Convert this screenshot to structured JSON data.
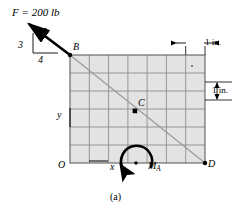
{
  "figure": {
    "caption": "(a)",
    "type": "statics free-body diagram",
    "grid": {
      "columns": 7,
      "rows": 6,
      "cell_size_label": "1 in.",
      "fill_color": "#e3e3e3",
      "line_color": "#8c8c8c",
      "border_color": "#6b6b6b",
      "origin_px": {
        "x": 70,
        "y": 163
      },
      "width_px": 135,
      "height_px": 108
    },
    "labels": {
      "force": "F = 200 lb",
      "slope_hyp": "5",
      "slope_vert": "3",
      "slope_horiz": "4",
      "point_B": "B",
      "point_C": "C",
      "point_D": "D",
      "point_O": "O",
      "point_A": "A",
      "axis_x": "x",
      "axis_y": "y",
      "moment": "M",
      "moment_sub": "A",
      "dim_top": "1 in.",
      "dim_right": "1 in."
    },
    "geometry": {
      "force_magnitude_lb": 200,
      "slope_triangle": {
        "rise": 3,
        "run": 4,
        "hypotenuse": 5
      },
      "line_of_action": "B to D",
      "point_B_px": {
        "x": 70,
        "y": 55
      },
      "point_C_px": {
        "x": 135,
        "y": 111
      },
      "point_D_px": {
        "x": 205,
        "y": 163
      },
      "point_A_px": {
        "x": 136,
        "y": 163
      },
      "arrow_tail_px": {
        "x": 26,
        "y": 22
      },
      "moment_sense": "counterclockwise"
    },
    "colors": {
      "ink": "#000000",
      "grid_fill": "#e3e3e3",
      "grid_line": "#8c8c8c",
      "action_line": "#9a9a9a"
    }
  }
}
